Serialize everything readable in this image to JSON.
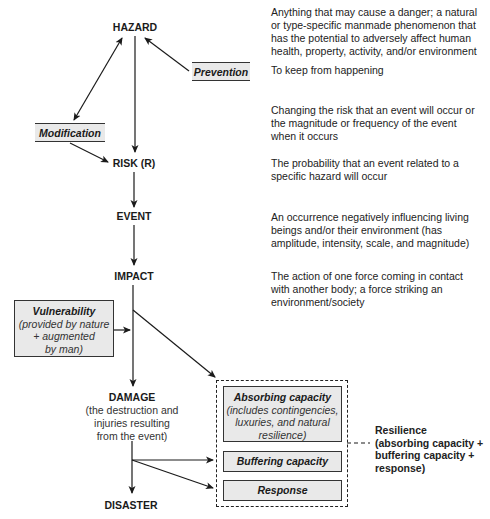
{
  "nodes": {
    "hazard": "HAZARD",
    "risk": "RISK (R)",
    "event": "EVENT",
    "impact": "IMPACT",
    "damage": "DAMAGE",
    "damage_sub": [
      "(the destruction and",
      "injuries resulting",
      "from the event)"
    ],
    "disaster": "DISASTER"
  },
  "modifiers": {
    "prevention": "Prevention",
    "modification": "Modification",
    "vulnerability": {
      "title": "Vulnerability",
      "sub": [
        "(provided by nature",
        "+ augmented",
        "by man)"
      ]
    }
  },
  "resilience_components": {
    "absorbing": {
      "title": "Absorbing capacity",
      "sub": [
        "(includes contingencies,",
        "luxuries, and natural",
        "resilience)"
      ]
    },
    "buffering": "Buffering capacity",
    "response": "Response"
  },
  "resilience_label": [
    "Resilience",
    "(absorbing capacity +",
    "buffering capacity +",
    "response)"
  ],
  "descriptions": {
    "hazard": [
      "Anything that may cause a danger; a natural",
      "or type-specific manmade phenomenon that",
      "has the potential to adversely affect human",
      "health, property, activity, and/or environment"
    ],
    "prevention": [
      "To keep from happening"
    ],
    "modification": [
      "Changing the risk that an event will occur or",
      "the magnitude or frequency of the event",
      "when it occurs"
    ],
    "risk": [
      "The probability that an event related to a",
      "specific hazard will occur"
    ],
    "event": [
      "An occurrence negatively influencing living",
      "beings and/or their environment (has",
      "amplitude, intensity, scale, and magnitude)"
    ],
    "impact": [
      "The action of one force coming in contact",
      "with another body; a force striking an",
      "environment/society"
    ]
  },
  "colors": {
    "box_fill": "#e9e9e9",
    "line": "#1a1a1a"
  }
}
